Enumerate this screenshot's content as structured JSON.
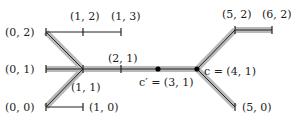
{
  "diagram": {
    "colors": {
      "line": "#222222",
      "highlight": "#b8b8b8",
      "dot": "#000000"
    },
    "labels": {
      "p02": "(0, 2)",
      "p12": "(1, 2)",
      "p13": "(1, 3)",
      "p01": "(0, 1)",
      "p11": "(1, 1)",
      "p21": "(2, 1)",
      "p00": "(0, 0)",
      "p10": "(1, 0)",
      "cprime": "c′ = (3, 1)",
      "c": "c = (4, 1)",
      "p52": "(5, 2)",
      "p62": "(6, 2)",
      "p50": "(5, 0)"
    }
  }
}
